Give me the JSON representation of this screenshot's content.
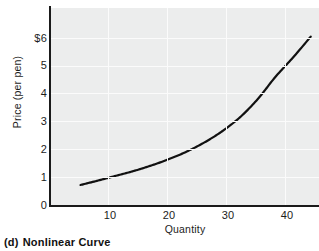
{
  "caption": {
    "tag": "(d)",
    "text": "Nonlinear Curve"
  },
  "chart_data": {
    "type": "line",
    "title": "",
    "subtitle": "",
    "xlabel": "Quantity",
    "ylabel": "Price (per pen)",
    "xlim": [
      0,
      45.4
    ],
    "ylim": [
      0,
      7.08
    ],
    "xticks": [
      10,
      20,
      30,
      40
    ],
    "xtick_labels": [
      "10",
      "20",
      "30",
      "40"
    ],
    "yticks": [
      0,
      1,
      2,
      3,
      4,
      5,
      6
    ],
    "ytick_labels": [
      "0",
      "1",
      "2",
      "3",
      "4",
      "5",
      "6"
    ],
    "ytick_top_label": "$6",
    "grid": true,
    "grid_color": "#fbfbfb",
    "plot_background": "#eceded",
    "axis_color": "#1a1a1a",
    "legend": null,
    "series": [
      {
        "name": "Price curve",
        "color": "#111111",
        "line_width": 2.2,
        "x": [
          5,
          8,
          11,
          14,
          17,
          20,
          23,
          26,
          29,
          32,
          35,
          38,
          41,
          44
        ],
        "y": [
          0.72,
          0.88,
          1.05,
          1.22,
          1.42,
          1.65,
          1.92,
          2.25,
          2.65,
          3.15,
          3.8,
          4.6,
          5.3,
          6.05
        ]
      }
    ],
    "annotations": []
  }
}
